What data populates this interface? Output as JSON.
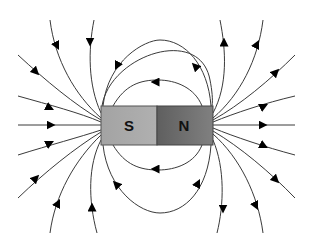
{
  "diagram": {
    "magnet": {
      "south_label": "S",
      "north_label": "N",
      "south_color": "#a9a9a9",
      "north_color": "#6b6b6b",
      "x": 101,
      "y": 106,
      "width": 112,
      "height": 39
    },
    "field_line_color": "#3a3a3a",
    "arrow_color": "#000000",
    "field_lines": {
      "left_incoming_count": 10,
      "right_outgoing_count": 10,
      "top_loops": 2,
      "bottom_loops": 2
    }
  }
}
